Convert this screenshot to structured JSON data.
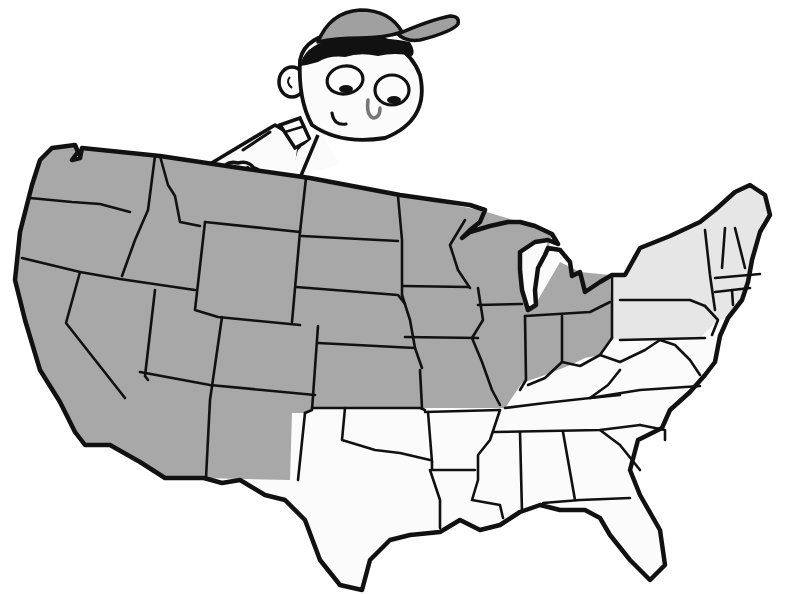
{
  "illustration": {
    "subject": "Cartoon boy peeking over a map of the contiguous United States",
    "character": {
      "name": "boy",
      "features": [
        "baseball-cap",
        "black-hair",
        "big-round-eyes",
        "smile",
        "hands-gripping-map"
      ]
    },
    "map": {
      "name": "united-states-map",
      "regions": [
        {
          "name": "west-and-midwest",
          "fill": "dark-gray",
          "color": "#a8a8a8"
        },
        {
          "name": "northeast",
          "fill": "light-gray",
          "color": "#e6e6e6"
        },
        {
          "name": "south",
          "fill": "white",
          "color": "#fbfbfb"
        }
      ]
    },
    "colors": {
      "background": "#ffffff",
      "outline": "#111111",
      "dark_fill": "#a8a8a8",
      "light_fill": "#e6e6e6",
      "cap": "#a0a0a0"
    }
  }
}
